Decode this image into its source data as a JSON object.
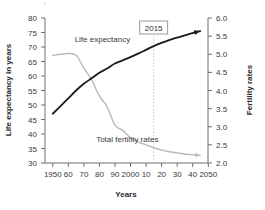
{
  "chart_data": {
    "type": "line",
    "title": "",
    "subtitle": "",
    "xlabel": "Years",
    "ylabel": "Life expectancy in years",
    "y2label": "Fertility rates",
    "grid": false,
    "legend_position": "inline-labels",
    "x": [
      1950,
      1955,
      1960,
      1965,
      1970,
      1975,
      1980,
      1985,
      1990,
      1995,
      2000,
      2005,
      2010,
      2015,
      2020,
      2025,
      2030,
      2035,
      2040,
      2045
    ],
    "xlim": [
      1945,
      2050
    ],
    "x_ticks": [
      1950,
      1960,
      1970,
      1980,
      1990,
      2000,
      2010,
      2020,
      2030,
      2040,
      2050
    ],
    "x_tick_labels": [
      "1950",
      "60",
      "70",
      "80",
      "90",
      "2000",
      "10",
      "20",
      "30",
      "40",
      "2050"
    ],
    "ylim": [
      30,
      80
    ],
    "y_ticks": [
      30,
      35,
      40,
      45,
      50,
      55,
      60,
      65,
      70,
      75,
      80
    ],
    "y_tick_labels": [
      "30",
      "35",
      "40",
      "45",
      "50",
      "55",
      "60",
      "65",
      "70",
      "75",
      "80"
    ],
    "y2lim": [
      2.0,
      6.0
    ],
    "y2_ticks": [
      2.0,
      2.5,
      3.0,
      3.5,
      4.0,
      4.5,
      5.0,
      5.5,
      6.0
    ],
    "y2_tick_labels": [
      "2.0",
      "2.5",
      "3.0",
      "3.5",
      "4.0",
      "4.5",
      "5.0",
      "5.5",
      "6.0"
    ],
    "series": [
      {
        "name": "Life expectancy",
        "label": "Life expectancy",
        "axis": "left",
        "color": "#1a1a1a",
        "width": 1.8,
        "arrow_end": true,
        "values": [
          47.0,
          49.6,
          52.3,
          55.0,
          57.3,
          59.2,
          61.1,
          62.6,
          64.3,
          65.4,
          66.5,
          67.7,
          69.0,
          70.3,
          71.4,
          72.4,
          73.2,
          74.0,
          74.8,
          75.5
        ]
      },
      {
        "name": "Total fertility rates",
        "label": "Total fertility rates",
        "axis": "right",
        "color": "#b9b9b9",
        "width": 1.4,
        "arrow_end": true,
        "values": [
          4.97,
          5.0,
          5.02,
          4.97,
          4.62,
          4.3,
          3.85,
          3.55,
          3.05,
          2.9,
          2.7,
          2.58,
          2.5,
          2.42,
          2.36,
          2.31,
          2.28,
          2.25,
          2.23,
          2.21
        ]
      }
    ],
    "annotations": [
      {
        "name": "year-marker",
        "text": "2015",
        "x": 2015,
        "type": "boxed-label-with-dashed-line",
        "line_color": "#c9c9c9"
      }
    ],
    "series_label_positions": [
      {
        "series": "Life expectancy",
        "x": 1982,
        "y_axis_value": 71.8
      },
      {
        "series": "Total fertility rates",
        "x": 1998,
        "y2_axis_value": 2.58
      }
    ]
  },
  "axes": {
    "left_axis_name": "life-expectancy-axis",
    "right_axis_name": "fertility-rates-axis",
    "bottom_axis_name": "years-axis"
  }
}
